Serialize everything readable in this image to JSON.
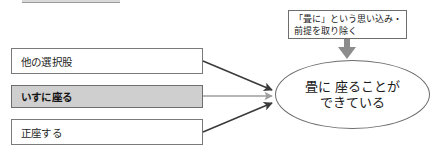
{
  "diagram": {
    "title_crop": "",
    "options": [
      {
        "label": "他の選択股",
        "shaded": false
      },
      {
        "label": "いすに座る",
        "shaded": true
      },
      {
        "label": "正座する",
        "shaded": false
      }
    ],
    "note": {
      "lines": [
        "「畳に」という思い込み・",
        "前提を取り除く"
      ]
    },
    "result": {
      "lines": [
        "畳に 座ることが",
        "できている"
      ]
    },
    "colors": {
      "shaded_fill": "#cfcfcf",
      "box_border": "#7a7a7a",
      "arrow_dark": "#3a3a3a",
      "arrow_light": "#9e9e9e",
      "note_arrow": "#8c8c8c",
      "text": "#1a1a1a",
      "background": "#ffffff"
    },
    "arrows": [
      {
        "name": "arrow-option-0-to-result",
        "from": "他の選択股",
        "to": "畳に 座ることができている",
        "style": "dark-diagonal-down"
      },
      {
        "name": "arrow-option-1-to-result",
        "from": "いすに座る",
        "to": "畳に 座ることができている",
        "style": "light-horizontal"
      },
      {
        "name": "arrow-option-2-to-result",
        "from": "正座する",
        "to": "畳に 座ることができている",
        "style": "dark-diagonal-up"
      },
      {
        "name": "arrow-note-to-result",
        "from": "「畳に」という思い込み・前提を取り除く",
        "to": "畳に 座ることができている",
        "style": "thick-gray-down"
      }
    ]
  }
}
